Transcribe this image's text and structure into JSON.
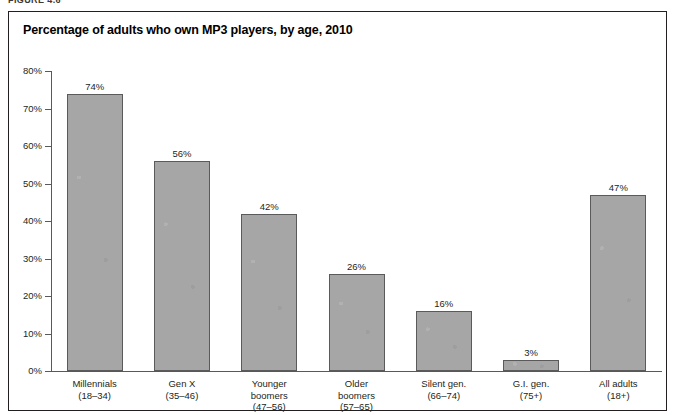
{
  "figure": {
    "caption": "FIGURE 4.6"
  },
  "chart_data": {
    "type": "bar",
    "title": "Percentage of adults who own MP3 players, by age, 2010",
    "xlabel": "",
    "ylabel": "",
    "ylim": [
      0,
      80
    ],
    "grid": false,
    "legend": null,
    "categories": [
      "Millennials",
      "Gen X",
      "Younger\nboomers",
      "Older\nboomers",
      "Silent gen.",
      "G.I. gen.",
      "All adults"
    ],
    "category_ranges": [
      "(18–34)",
      "(35–46)",
      "(47–56)",
      "(57–65)",
      "(66–74)",
      "(75+)",
      "(18+)"
    ],
    "values": [
      74,
      56,
      42,
      26,
      16,
      3,
      47
    ],
    "value_labels": [
      "74%",
      "56%",
      "42%",
      "26%",
      "16%",
      "3%",
      "47%"
    ],
    "ytick_values": [
      0,
      10,
      20,
      30,
      40,
      50,
      60,
      70,
      80
    ],
    "ytick_labels": [
      "0%",
      "10%",
      "20%",
      "30%",
      "40%",
      "50%",
      "60%",
      "70%",
      "80%"
    ],
    "colors": {
      "bar_fill": "#a6a6a6",
      "bar_border": "#5a5a5a",
      "axis": "#58595b",
      "text": "#231f20",
      "panel_border": "#231f20",
      "background": "#ffffff"
    }
  }
}
